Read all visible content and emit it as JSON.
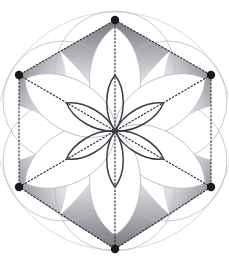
{
  "figure": {
    "width": 229,
    "height": 271,
    "background_color": "#ffffff",
    "center": {
      "x": 115,
      "y": 131
    },
    "unit_radius": 60
  },
  "colors": {
    "vertex_dot": "#1a1a1a",
    "dotted_line": "#2b2b2b",
    "circle_outline": "#b9b9c4",
    "rosette_outline": "#3c3c46",
    "shade_dark": "#6f6f79",
    "shade_light": "#ffffff",
    "petal_fill": "#ffffff"
  },
  "hexagon": {
    "name": "dotted-hexagon",
    "stroke": "#2b2b2b",
    "stroke_width": 1.1,
    "dash_pattern": "1.4 2.2",
    "vertices": [
      {
        "label": "top",
        "x": 115,
        "y": 20
      },
      {
        "label": "upper-right",
        "x": 211,
        "y": 75
      },
      {
        "label": "lower-right",
        "x": 211,
        "y": 187
      },
      {
        "label": "bottom",
        "x": 115,
        "y": 249
      },
      {
        "label": "lower-left",
        "x": 19,
        "y": 187
      },
      {
        "label": "upper-left",
        "x": 19,
        "y": 75
      }
    ]
  },
  "vertex_dots": {
    "name": "hexagon-vertex-dots",
    "radius": 4.2,
    "count": 6,
    "fill": "#1a1a1a"
  },
  "spokes": {
    "name": "center-spokes",
    "description": "dotted radii from each hexagon vertex to the center",
    "count": 6,
    "stroke": "#2b2b2b",
    "dash_pattern": "1.4 2.2"
  },
  "circles": {
    "name": "seed-of-life-circles",
    "count": 6,
    "radius": 60,
    "outline": "#b9b9c4",
    "outline_width": 0.8,
    "centers": [
      {
        "label": "north",
        "x": 115,
        "y": 71
      },
      {
        "label": "northeast",
        "x": 167,
        "y": 101
      },
      {
        "label": "southeast",
        "x": 167,
        "y": 161
      },
      {
        "label": "south",
        "x": 115,
        "y": 191
      },
      {
        "label": "southwest",
        "x": 63,
        "y": 161
      },
      {
        "label": "northwest",
        "x": 63,
        "y": 101
      }
    ]
  },
  "outer_circle": {
    "name": "enclosing-circle",
    "cx": 115,
    "cy": 131,
    "r": 120,
    "outline": "#c8c8d0"
  },
  "rosette": {
    "name": "central-six-petal-rosette",
    "petal_count": 6,
    "petal_length": 56,
    "petal_width": 21,
    "stroke": "#3c3c46",
    "stroke_width": 1.5,
    "fill": "none",
    "rotations_deg": [
      0,
      60,
      120,
      180,
      240,
      300
    ]
  },
  "shading": {
    "name": "gradient-wedges",
    "description": "six gradient-shaded interstitial wedges between the petals and the hexagon edges",
    "count": 6,
    "from": "#6f6f79",
    "to": "#ffffff"
  },
  "big_petals": {
    "name": "six-large-white-petals",
    "count": 6,
    "fill": "#ffffff",
    "outline": "#b9b9c4"
  }
}
